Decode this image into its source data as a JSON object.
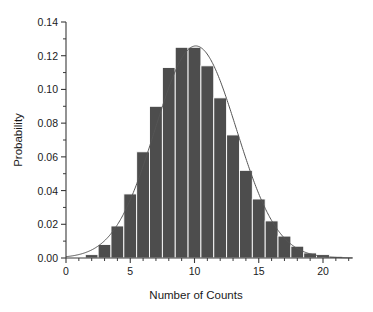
{
  "chart_data": {
    "type": "bar",
    "title": "",
    "xlabel": "Number of Counts",
    "ylabel": "Probability",
    "xlim": [
      0,
      22.3
    ],
    "ylim": [
      0.0,
      0.14
    ],
    "grid": false,
    "legend": "none",
    "bar_color": "#4d4d4d",
    "curve_color": "#555555",
    "axis_color": "#3a3a3a",
    "categories": [
      1,
      2,
      3,
      4,
      5,
      6,
      7,
      8,
      9,
      10,
      11,
      12,
      13,
      14,
      15,
      16,
      17,
      18,
      19,
      20,
      21
    ],
    "values": [
      0.0,
      0.002,
      0.008,
      0.019,
      0.038,
      0.063,
      0.09,
      0.113,
      0.125,
      0.125,
      0.114,
      0.095,
      0.073,
      0.052,
      0.035,
      0.022,
      0.013,
      0.007,
      0.003,
      0.002,
      0.001
    ],
    "bar_width": 1.0,
    "series": [
      {
        "name": "Probability histogram",
        "type": "bar",
        "values": [
          0.0,
          0.002,
          0.008,
          0.019,
          0.038,
          0.063,
          0.09,
          0.113,
          0.125,
          0.125,
          0.114,
          0.095,
          0.073,
          0.052,
          0.035,
          0.022,
          0.013,
          0.007,
          0.003,
          0.002,
          0.001
        ]
      },
      {
        "name": "Gaussian fit",
        "type": "line",
        "mean": 10.1,
        "sigma": 3.17,
        "amplitude": 0.1258
      }
    ],
    "xticks": [
      0,
      5,
      10,
      15,
      20
    ],
    "xtick_labels": [
      "0",
      "5",
      "10",
      "15",
      "20"
    ],
    "xminor_step": 1,
    "yticks": [
      0.0,
      0.02,
      0.04,
      0.06,
      0.08,
      0.1,
      0.12,
      0.14
    ],
    "ytick_labels": [
      "0.00",
      "0.02",
      "0.04",
      "0.06",
      "0.08",
      "0.10",
      "0.12",
      "0.14"
    ],
    "yminor_step": 0.01
  },
  "figure": {
    "background": "#ffffff"
  }
}
